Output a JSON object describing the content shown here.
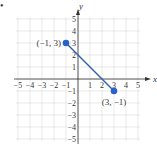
{
  "bullet": "•",
  "chart_data": {
    "type": "line",
    "title": "",
    "xlabel": "x",
    "ylabel": "y",
    "xlim": [
      -5,
      5
    ],
    "ylim": [
      -5,
      5
    ],
    "grid": true,
    "x_ticks": [
      "−5",
      "−4",
      "−3",
      "−2",
      "−1",
      "1",
      "2",
      "3",
      "4",
      "5"
    ],
    "y_ticks": [
      "5",
      "4",
      "3",
      "2",
      "1",
      "−1",
      "−2",
      "−3",
      "−4",
      "−5"
    ],
    "series": [
      {
        "name": "segment",
        "x": [
          -1,
          3
        ],
        "y": [
          3,
          -1
        ],
        "color": "#2f5fb3"
      }
    ],
    "annotations": [
      {
        "text": "(−1, 3)",
        "x": -1,
        "y": 3
      },
      {
        "text": "(3, −1)",
        "x": 3,
        "y": -1
      }
    ]
  },
  "colors": {
    "grid": "#d9d9d9",
    "axis": "#333333",
    "line": "#2f5fb3",
    "point": "#2a62c9",
    "text": "#333333"
  }
}
